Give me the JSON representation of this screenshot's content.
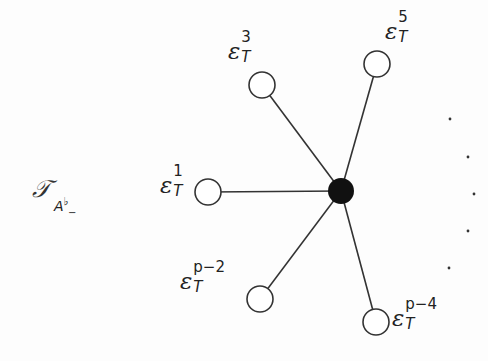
{
  "diagram": {
    "title": {
      "symbol": "𝒯",
      "subscript_base": "A",
      "subscript_sup": "♭",
      "subscript_sub": "−"
    },
    "center_node": {
      "x": 341,
      "y": 191,
      "r": 13,
      "fill": "#111111"
    },
    "leaf_nodes": [
      {
        "id": "eps1",
        "x": 208,
        "y": 192,
        "r": 13,
        "label_base": "ε",
        "label_sup": "1",
        "label_sub": "T",
        "label_x": 160,
        "label_y": 174,
        "sup_w": 14
      },
      {
        "id": "eps3",
        "x": 262,
        "y": 85,
        "r": 13,
        "label_base": "ε",
        "label_sup": "3",
        "label_sub": "T",
        "label_x": 228,
        "label_y": 40,
        "sup_w": 14
      },
      {
        "id": "eps5",
        "x": 377,
        "y": 64,
        "r": 13,
        "label_base": "ε",
        "label_sup": "5",
        "label_sub": "T",
        "label_x": 385,
        "label_y": 20,
        "sup_w": 14
      },
      {
        "id": "epsp2",
        "x": 260,
        "y": 299,
        "r": 13,
        "label_base": "ε",
        "label_sup": "p−2",
        "label_sub": "T",
        "label_x": 180,
        "label_y": 270,
        "sup_w": 40
      },
      {
        "id": "epsp4",
        "x": 376,
        "y": 322,
        "r": 13,
        "label_base": "ε",
        "label_sup": "p−4",
        "label_sub": "T",
        "label_x": 392,
        "label_y": 307,
        "sup_w": 40
      }
    ],
    "ellipsis_dots": [
      {
        "x": 450,
        "y": 119
      },
      {
        "x": 468,
        "y": 157
      },
      {
        "x": 474,
        "y": 194
      },
      {
        "x": 468,
        "y": 231
      },
      {
        "x": 449,
        "y": 268
      }
    ],
    "colors": {
      "edge": "#333333",
      "node_stroke": "#333333",
      "node_fill": "#ffffff",
      "center_fill": "#111111"
    }
  }
}
